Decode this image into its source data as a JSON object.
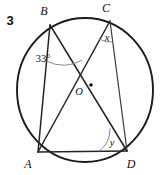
{
  "figure": {
    "problem_number": "3",
    "type": "circle-with-inscribed-quadrilateral",
    "canvas": {
      "width": 167,
      "height": 175
    },
    "circle": {
      "name": "circumscribed-circle",
      "center_x": 85,
      "center_y": 90,
      "radius": 68,
      "stroke": "#1a1a1a"
    },
    "center_point": {
      "label": "O",
      "x": 91,
      "y": 85,
      "label_x": 79,
      "label_y": 95,
      "dot_radius": 1.8
    },
    "vertices": [
      {
        "id": "B",
        "label": "B",
        "x": 50,
        "y": 25,
        "label_x": 44,
        "label_y": 15
      },
      {
        "id": "C",
        "label": "C",
        "x": 110,
        "y": 21,
        "label_x": 106,
        "label_y": 12
      },
      {
        "id": "A",
        "label": "A",
        "x": 38,
        "y": 152,
        "label_x": 28,
        "label_y": 166
      },
      {
        "id": "D",
        "label": "D",
        "x": 127,
        "y": 151,
        "label_x": 128,
        "label_y": 166
      }
    ],
    "chords": [
      {
        "id": "BA",
        "from": "B",
        "to": "A",
        "weight": "normal"
      },
      {
        "id": "BD",
        "from": "B",
        "to": "D",
        "weight": "normal"
      },
      {
        "id": "CA",
        "from": "C",
        "to": "A",
        "weight": "normal"
      },
      {
        "id": "CD",
        "from": "C",
        "to": "D",
        "weight": "thin"
      },
      {
        "id": "AD",
        "from": "A",
        "to": "D",
        "weight": "normal"
      }
    ],
    "angles": [
      {
        "id": "angle-ABD",
        "vertex": "B",
        "label": "33°",
        "value": 33,
        "unit": "degrees",
        "label_x": 43,
        "label_y": 62,
        "arc_radius": 36
      },
      {
        "id": "angle-ACD",
        "vertex": "C",
        "label": "x",
        "value": null,
        "unit": "unknown",
        "label_x": 107,
        "label_y": 40,
        "arc_radius": 21
      },
      {
        "id": "angle-ADB",
        "vertex": "D",
        "label": "y",
        "value": null,
        "unit": "unknown",
        "label_x": 112,
        "label_y": 145,
        "arc_radius": 28
      }
    ]
  }
}
